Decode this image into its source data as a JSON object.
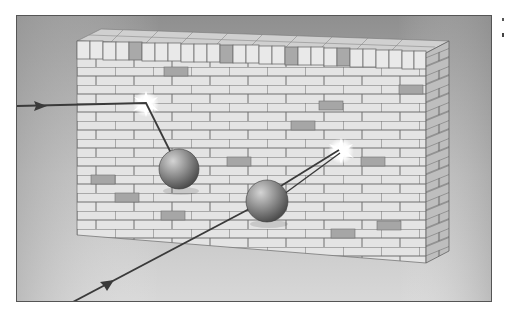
{
  "figure": {
    "colors": {
      "frame_border": "#555555",
      "background_top": "#8f8f8f",
      "background_bottom": "#d8d8d8",
      "brick_light": "#e6e6e6",
      "brick_dark": "#a8a8a8",
      "mortar": "#6d6d6d",
      "path_line": "#3a3a3a",
      "sphere_light": "#b9b9b9",
      "sphere_dark": "#4d4d4d",
      "impact_flash": "#ffffff"
    },
    "elements": {
      "wall": {
        "label": "brick wall",
        "shape": "3D rectangular block"
      },
      "sphere_1": {
        "label": "ball",
        "center": [
          178,
          168
        ],
        "radius": 20
      },
      "sphere_2": {
        "label": "ball",
        "center": [
          266,
          200
        ],
        "radius": 21
      },
      "path_1": {
        "label": "trajectory",
        "arrow": "right-pointing",
        "points": [
          [
            16,
            105
          ],
          [
            145,
            103
          ],
          [
            170,
            150
          ]
        ]
      },
      "path_2": {
        "label": "trajectory",
        "arrow": "up-right-pointing",
        "points": [
          [
            70,
            302
          ],
          [
            266,
            200
          ],
          [
            338,
            148
          ]
        ]
      },
      "impact_1": {
        "label": "impact flash",
        "center": [
          145,
          103
        ]
      },
      "impact_2": {
        "label": "impact flash",
        "center": [
          340,
          150
        ]
      }
    }
  }
}
